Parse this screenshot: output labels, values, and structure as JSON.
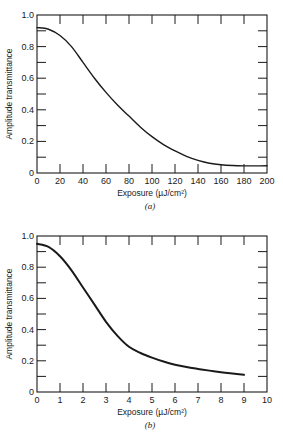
{
  "chart_data": [
    {
      "type": "line",
      "caption": "(a)",
      "title": "",
      "xlabel": "Exposure (µJ/cm²)",
      "ylabel": "Amplitude transmittance",
      "xlim": [
        0,
        200
      ],
      "ylim": [
        0,
        1.0
      ],
      "xticks": [
        "0",
        "20",
        "40",
        "60",
        "80",
        "100",
        "120",
        "140",
        "160",
        "180",
        "200"
      ],
      "yticks": [
        "0",
        "0.2",
        "0.4",
        "0.6",
        "0.8",
        "1.0"
      ],
      "grid": false,
      "series": [
        {
          "name": "transmittance",
          "x": [
            0,
            10,
            20,
            30,
            40,
            50,
            60,
            70,
            80,
            90,
            100,
            110,
            120,
            130,
            140,
            150,
            160,
            170,
            180,
            190,
            200
          ],
          "y": [
            0.92,
            0.91,
            0.87,
            0.8,
            0.7,
            0.6,
            0.51,
            0.43,
            0.36,
            0.29,
            0.23,
            0.18,
            0.14,
            0.105,
            0.08,
            0.062,
            0.052,
            0.047,
            0.045,
            0.045,
            0.046
          ]
        }
      ]
    },
    {
      "type": "line",
      "caption": "(b)",
      "title": "",
      "xlabel": "Exposure (µJ/cm²)",
      "ylabel": "Amplitude transmittance",
      "xlim": [
        0,
        10
      ],
      "ylim": [
        0,
        1.0
      ],
      "xticks": [
        "0",
        "1",
        "2",
        "3",
        "4",
        "5",
        "6",
        "7",
        "8",
        "9",
        "10"
      ],
      "yticks": [
        "0",
        "0.2",
        "0.4",
        "0.6",
        "0.8",
        "1.0"
      ],
      "grid": false,
      "series": [
        {
          "name": "transmittance",
          "x": [
            0,
            0.5,
            1.0,
            1.5,
            2.0,
            2.5,
            3.0,
            3.5,
            4.0,
            4.5,
            5.0,
            5.5,
            6.0,
            6.5,
            7.0,
            7.5,
            8.0,
            8.5,
            9.0
          ],
          "y": [
            0.95,
            0.93,
            0.87,
            0.78,
            0.67,
            0.56,
            0.45,
            0.36,
            0.29,
            0.25,
            0.22,
            0.195,
            0.175,
            0.16,
            0.148,
            0.137,
            0.127,
            0.118,
            0.11
          ]
        }
      ]
    }
  ]
}
